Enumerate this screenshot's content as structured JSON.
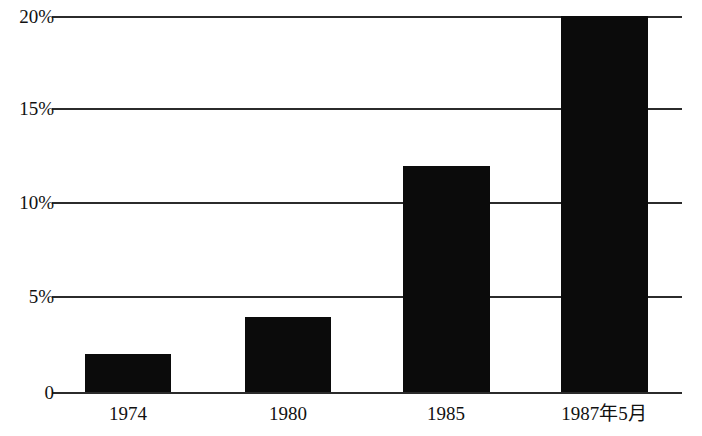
{
  "chart_data": {
    "type": "bar",
    "title": "",
    "subtitle": "",
    "xlabel": "",
    "ylabel": "",
    "categories": [
      "1974",
      "1980",
      "1985",
      "1987年5月"
    ],
    "values": [
      2,
      4,
      12,
      20
    ],
    "value_unit": "%",
    "ylim": [
      0,
      20
    ],
    "yticks": [
      0,
      5,
      10,
      15,
      20
    ],
    "ytick_labels": [
      "0",
      "5%",
      "10%",
      "15%",
      "20%"
    ],
    "grid": true,
    "grid_axis": "y",
    "legend": false,
    "legend_position": "none",
    "bar_color": "#0b0b0b",
    "grid_color": "#2b2b2b",
    "background_color": "#ffffff",
    "series": [
      {
        "name": "",
        "values": [
          2,
          4,
          12,
          20
        ]
      }
    ]
  },
  "axes": {
    "y": {
      "ticks": [
        {
          "label": "20%",
          "value": 20
        },
        {
          "label": "15%",
          "value": 15
        },
        {
          "label": "10%",
          "value": 10
        },
        {
          "label": "5%",
          "value": 5
        },
        {
          "label": "0",
          "value": 0
        }
      ]
    },
    "x": {
      "ticks": [
        {
          "label": "1974"
        },
        {
          "label": "1980"
        },
        {
          "label": "1985"
        },
        {
          "label": "1987年5月"
        }
      ]
    }
  },
  "bars": [
    {
      "category": "1974",
      "value": 2
    },
    {
      "category": "1980",
      "value": 4
    },
    {
      "category": "1985",
      "value": 12
    },
    {
      "category": "1987年5月",
      "value": 20
    }
  ]
}
